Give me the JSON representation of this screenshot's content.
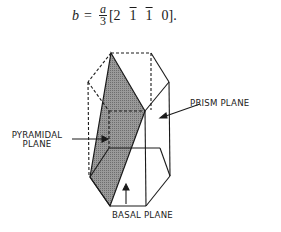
{
  "equation": {
    "lhs": "b",
    "equals": "=",
    "fraction": {
      "numerator": "a",
      "denominator": "3"
    },
    "indices": [
      {
        "value": "2",
        "bar": false
      },
      {
        "value": "1",
        "bar": true
      },
      {
        "value": "1",
        "bar": true
      },
      {
        "value": "0",
        "bar": false
      }
    ],
    "open_bracket": "[",
    "close_bracket": "].",
    "text": "b = a/3 [2 1̄ 1̄ 0]."
  },
  "figure": {
    "type": "hexagonal-prism-crystal-planes",
    "labels": {
      "prism": "PRISM PLANE",
      "pyramidal_line1": "PYRAMIDAL",
      "pyramidal_line2": "PLANE",
      "basal": "BASAL PLANE"
    },
    "colors": {
      "line": "#1a1a1a",
      "shaded_plane": "#8a8a8a"
    }
  }
}
